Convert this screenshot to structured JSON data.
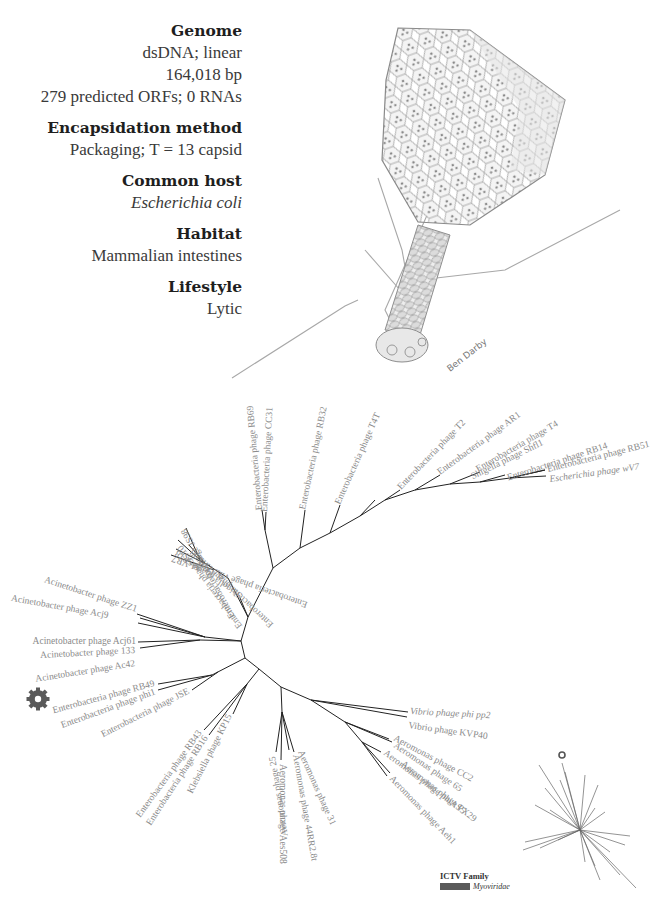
{
  "info": {
    "sections": [
      {
        "heading": "Genome",
        "values": [
          "dsDNA; linear",
          "164,018 bp",
          "279 predicted ORFs; 0 RNAs"
        ]
      },
      {
        "heading": "Encapsidation method",
        "values": [
          "Packaging; T = 13 capsid"
        ]
      },
      {
        "heading": "Common host",
        "values": [
          "Escherichia coli"
        ],
        "italic": true
      },
      {
        "heading": "Habitat",
        "values": [
          "Mammalian intestines"
        ]
      },
      {
        "heading": "Lifestyle",
        "values": [
          "Lytic"
        ]
      }
    ]
  },
  "illustration": {
    "signature": "Ben Darby",
    "subject": "phage-virion-drawing"
  },
  "tree": {
    "highlighted_leaf": "Enterobacteria phage RB49",
    "leaves": [
      "Enterobacteria phage JS98",
      "Enterobacteria phage JS10",
      "Enterobacteria phage IME08",
      "Shigella phage SP18",
      "Enterobacteria phage vB_EcoM-VR7",
      "Enterobacteria phage RB69",
      "Enterobacteria phage CC31",
      "Enterobacteria phage RB32",
      "Enterobacteria phage T4T",
      "Enterobacteria phage T2",
      "Enterobacteria phage AR1",
      "Enterobacteria phage T4",
      "Shigella phage Shfl1",
      "Enterobacteria phage RB14",
      "Enterobacteria phage RB51",
      "Escherichia phage wV7",
      "Acinetobacter phage ZZ1",
      "Acinetobacter phage Acj9",
      "Acinetobacter phage Acj61",
      "Acinetobacter phage 133",
      "Acinetobacter phage Ac42",
      "Enterobacteria phage RB49",
      "Enterobacteria phage phi1",
      "Enterobacteria phage JSE",
      "Enterobacteria phage RB43",
      "Enterobacteria phage RB16",
      "Klebsiella phage KP15",
      "Aeromonas phage 25",
      "Aeromonas phage Aes508",
      "Aeromonas phage 44RR2.8t",
      "Aeromonas phage 31",
      "Vibrio phage phi pp2",
      "Vibrio phage KVP40",
      "Aeromonas phage CC2",
      "Aeromonas phage 65",
      "Aeromonas phage phiAS5",
      "Aeromonas phage PX29",
      "Aeromonas phage Aeh1"
    ]
  },
  "legend": {
    "title": "ICTV Family",
    "family": "Myoviridae",
    "color": "#5a5a5a"
  }
}
